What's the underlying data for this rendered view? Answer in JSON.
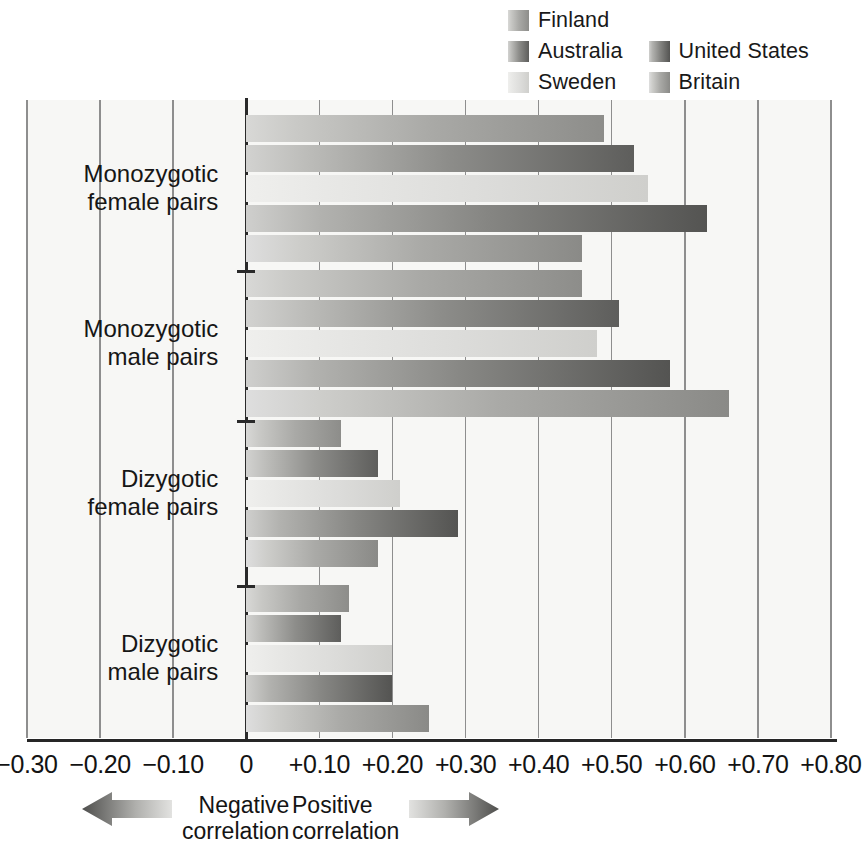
{
  "chart_data": {
    "type": "bar",
    "orientation": "horizontal",
    "title": "",
    "xlabel": "",
    "ylabel": "",
    "xlim": [
      -0.3,
      0.8
    ],
    "xticks": [
      "-0.30",
      "-0.20",
      "-0.10",
      "0",
      "+0.10",
      "+0.20",
      "+0.30",
      "+0.40",
      "+0.50",
      "+0.60",
      "+0.70",
      "+0.80"
    ],
    "xtick_values": [
      -0.3,
      -0.2,
      -0.1,
      0,
      0.1,
      0.2,
      0.3,
      0.4,
      0.5,
      0.6,
      0.7,
      0.8
    ],
    "grid": true,
    "legend_position": "top-right",
    "series": [
      {
        "name": "Finland",
        "color": "#a2a29f"
      },
      {
        "name": "Australia",
        "color": "#6d6d6a"
      },
      {
        "name": "Sweden",
        "color": "#dededc"
      },
      {
        "name": "United States",
        "color": "#7b7b78"
      },
      {
        "name": "Britain",
        "color": "#9e9e9b"
      }
    ],
    "categories": [
      "Monozygotic\nfemale pairs",
      "Monozygotic\nmale pairs",
      "Dizygotic\nfemale pairs",
      "Dizygotic\nmale pairs"
    ],
    "groups": [
      {
        "category": "Monozygotic female pairs",
        "bars": [
          {
            "series": "Finland",
            "value": 0.49
          },
          {
            "series": "Australia",
            "value": 0.53
          },
          {
            "series": "Sweden",
            "value": 0.55
          },
          {
            "series": "United States",
            "value": 0.63
          },
          {
            "series": "Britain",
            "value": 0.46
          }
        ]
      },
      {
        "category": "Monozygotic male pairs",
        "bars": [
          {
            "series": "Finland",
            "value": 0.46
          },
          {
            "series": "Australia",
            "value": 0.51
          },
          {
            "series": "Sweden",
            "value": 0.48
          },
          {
            "series": "United States",
            "value": 0.58
          },
          {
            "series": "Britain",
            "value": 0.66
          }
        ]
      },
      {
        "category": "Dizygotic female pairs",
        "bars": [
          {
            "series": "Finland",
            "value": 0.13
          },
          {
            "series": "Australia",
            "value": 0.18
          },
          {
            "series": "Sweden",
            "value": 0.21
          },
          {
            "series": "United States",
            "value": 0.29
          },
          {
            "series": "Britain",
            "value": 0.18
          }
        ]
      },
      {
        "category": "Dizygotic male pairs",
        "bars": [
          {
            "series": "Finland",
            "value": 0.14
          },
          {
            "series": "Australia",
            "value": 0.13
          },
          {
            "series": "Sweden",
            "value": 0.2
          },
          {
            "series": "United States",
            "value": 0.2
          },
          {
            "series": "Britain",
            "value": 0.25
          }
        ]
      }
    ],
    "annotations": [
      {
        "name": "negative-correlation",
        "text": "Negative\ncorrelation",
        "direction": "left"
      },
      {
        "name": "positive-correlation",
        "text": "Positive\ncorrelation",
        "direction": "right"
      }
    ]
  },
  "legend": {
    "items": [
      {
        "label": "Finland",
        "swatch": "fill-finland"
      },
      {
        "label": "Australia",
        "swatch": "fill-australia"
      },
      {
        "label": "United States",
        "swatch": "fill-us"
      },
      {
        "label": "Sweden",
        "swatch": "fill-sweden"
      },
      {
        "label": "Britain",
        "swatch": "fill-britain"
      }
    ]
  },
  "axis": {
    "labels": [
      "-0.30",
      "-0.20",
      "-0.10",
      "0",
      "+0.10",
      "+0.20",
      "+0.30",
      "+0.40",
      "+0.50",
      "+0.60",
      "+0.70",
      "+0.80"
    ]
  },
  "key": {
    "negative": "Negative\ncorrelation",
    "positive": "Positive\ncorrelation"
  },
  "group_labels": [
    "Monozygotic\nfemale pairs",
    "Monozygotic\nmale pairs",
    "Dizygotic\nfemale pairs",
    "Dizygotic\nmale pairs"
  ],
  "colors": {
    "grid": "#8e8e8e",
    "axis": "#262626",
    "plot_background": "#f7f7f5",
    "page_background": "#ffffff"
  }
}
